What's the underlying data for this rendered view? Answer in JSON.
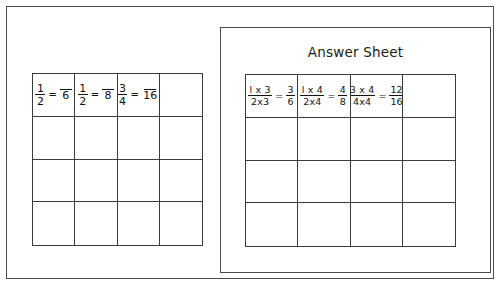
{
  "worksheet": {
    "title_left": "",
    "exercise_grid": {
      "columns": 4,
      "rows": 4,
      "cells": [
        {
          "left_num": "1",
          "left_den": "2",
          "op": "=",
          "right_num": "",
          "right_den": "6"
        },
        {
          "left_num": "1",
          "left_den": "2",
          "op": "=",
          "right_num": "",
          "right_den": "8"
        },
        {
          "left_num": "3",
          "left_den": "4",
          "op": "=",
          "right_num": "",
          "right_den": "16"
        },
        {
          "left_num": "",
          "left_den": "",
          "op": "",
          "right_num": "",
          "right_den": ""
        }
      ]
    }
  },
  "answer_sheet": {
    "title": "Answer Sheet",
    "answer_grid": {
      "columns": 4,
      "rows": 4,
      "cells": [
        {
          "left_num": "l x 3",
          "left_den": "2x3",
          "op": "=",
          "right_num": "3",
          "right_den": "6"
        },
        {
          "left_num": "l x 4",
          "left_den": "2x4",
          "op": "=",
          "right_num": "4",
          "right_den": "8"
        },
        {
          "left_num": "3 x 4",
          "left_den": "4x4",
          "op": "=",
          "right_num": "12",
          "right_den": "16"
        },
        {
          "left_num": "",
          "left_den": "",
          "op": "",
          "right_num": "",
          "right_den": ""
        }
      ]
    }
  },
  "colors": {
    "frame": "#4a4a4a",
    "grid_line": "#3a3a3a",
    "ink": "#111111",
    "background": "#ffffff"
  }
}
